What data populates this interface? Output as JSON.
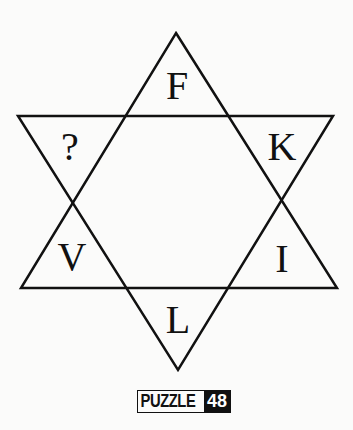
{
  "puzzle": {
    "shape": "six-pointed star",
    "letters": {
      "top": "F",
      "upper_right": "K",
      "lower_right": "I",
      "bottom": "L",
      "lower_left": "V",
      "upper_left": "?"
    },
    "badge": {
      "word": "PUZZLE",
      "number": "48"
    }
  }
}
